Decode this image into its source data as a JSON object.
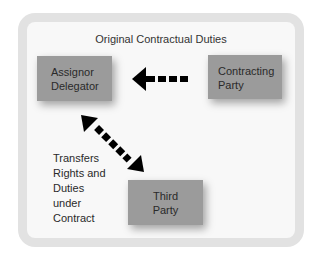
{
  "diagram": {
    "title": "Original Contractual Duties",
    "nodes": [
      {
        "id": "assignor",
        "lines": [
          "Assignor",
          "Delegator"
        ]
      },
      {
        "id": "contracting",
        "lines": [
          "Contracting",
          "Party"
        ]
      },
      {
        "id": "third",
        "lines": [
          "Third",
          "Party"
        ]
      }
    ],
    "edges": [
      {
        "from": "contracting",
        "to": "assignor",
        "style": "dashed",
        "direction": "single"
      },
      {
        "from": "assignor",
        "to": "third",
        "style": "dashed",
        "direction": "double"
      }
    ],
    "annotation": [
      "Transfers",
      "Rights and",
      "Duties",
      "under",
      "Contract"
    ],
    "colors": {
      "frame": "#e2e2e2",
      "panel": "#f8f8f8",
      "box": "#9b9b9b",
      "arrow": "#000000"
    }
  }
}
